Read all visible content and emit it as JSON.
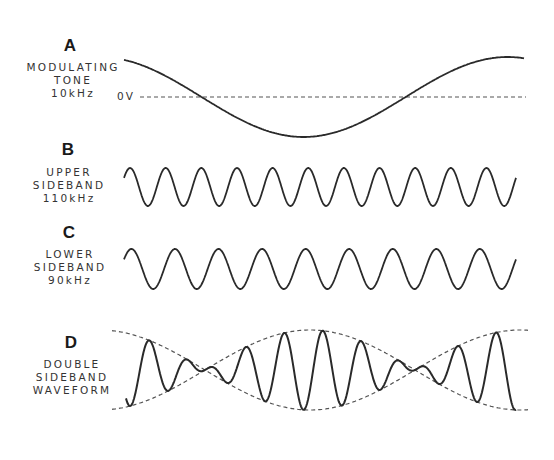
{
  "panels": [
    {
      "id": "A",
      "letter": "A",
      "label_lines": [
        "MODULATING",
        "TONE",
        "10kHz"
      ],
      "zero_label": "0V"
    },
    {
      "id": "B",
      "letter": "B",
      "label_lines": [
        "UPPER",
        "SIDEBAND",
        "110kHz"
      ]
    },
    {
      "id": "C",
      "letter": "C",
      "label_lines": [
        "LOWER",
        "SIDEBAND",
        "90kHz"
      ]
    },
    {
      "id": "D",
      "letter": "D",
      "label_lines": [
        "DOUBLE",
        "SIDEBAND",
        "WAVEFORM"
      ]
    }
  ],
  "waves": {
    "x_start": 124,
    "x_end": 516,
    "modulating": {
      "center_y": 97,
      "amplitude": 40,
      "x_end": 524,
      "cycles": 1.0,
      "frequency_khz": 10
    },
    "upper_sideband": {
      "center_y": 187,
      "amplitude": 19,
      "cycles": 11,
      "frequency_khz": 110
    },
    "lower_sideband": {
      "center_y": 269,
      "amplitude": 20,
      "cycles": 9,
      "frequency_khz": 90
    },
    "dsb": {
      "center_y": 370,
      "amplitude": 40
    }
  },
  "colors": {
    "line": "#2a2a2a",
    "dashed": "#555555",
    "background": "#ffffff"
  }
}
